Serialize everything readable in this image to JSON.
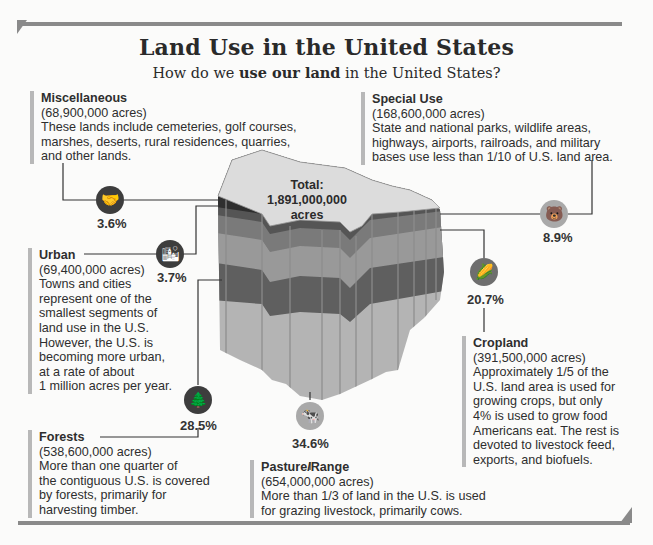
{
  "header": {
    "title": "Land Use in the United States",
    "subtitle_pre": "How do we ",
    "subtitle_bold": "use our land",
    "subtitle_post": " in the United States?"
  },
  "map": {
    "total_label": "Total:",
    "total_value": "1,891,000,000",
    "total_unit": "acres"
  },
  "categories": {
    "miscellaneous": {
      "name": "Miscellaneous",
      "acres": "(68,900,000 acres)",
      "lines": [
        "These lands include cemeteries, golf courses,",
        "marshes, deserts, rural residences, quarries,",
        "and other lands."
      ],
      "percent": "3.6%",
      "icon": "handshake-icon"
    },
    "special_use": {
      "name": "Special Use",
      "acres": "(168,600,000 acres)",
      "lines": [
        "State and national parks, wildlife areas,",
        "highways, airports, railroads, and military",
        "bases use less than 1/10 of U.S. land area."
      ],
      "percent": "8.9%",
      "icon": "bear-icon"
    },
    "urban": {
      "name": "Urban",
      "acres": "(69,400,000 acres)",
      "lines": [
        "Towns and cities",
        "represent one of the",
        "smallest segments of",
        "land use in the U.S.",
        "However, the U.S. is",
        "becoming more urban,",
        "at a rate of about",
        "1 million acres per year."
      ],
      "percent": "3.7%",
      "icon": "city-skyline-icon"
    },
    "cropland": {
      "name": "Cropland",
      "acres": "(391,500,000 acres)",
      "lines": [
        "Approximately 1/5 of the",
        "U.S. land area is used for",
        "growing crops, but only",
        "4% is used to grow food",
        "Americans eat. The rest is",
        "devoted to livestock feed,",
        "exports, and biofuels."
      ],
      "percent": "20.7%",
      "icon": "corn-icon"
    },
    "forests": {
      "name": "Forests",
      "acres": "(538,600,000 acres)",
      "lines": [
        "More than one quarter of",
        "the contiguous U.S. is covered",
        "by forests, primarily for",
        "harvesting timber."
      ],
      "percent": "28.5%",
      "icon": "tree-icon"
    },
    "pasture": {
      "name": "Pasture/Range",
      "acres": "(654,000,000 acres)",
      "lines": [
        "More than 1/3 of land in the U.S. is used",
        "for grazing livestock, primarily cows."
      ],
      "percent": "34.6%",
      "icon": "cow-icon"
    }
  },
  "colors": {
    "map_top": "#dcdcdc",
    "layer_misc": "#2f2f2f",
    "layer_urban": "#555555",
    "layer_special": "#7a7a7a",
    "layer_cropland": "#9a9a9a",
    "layer_forest": "#5f5f5f",
    "layer_pasture": "#b5b5b5"
  }
}
